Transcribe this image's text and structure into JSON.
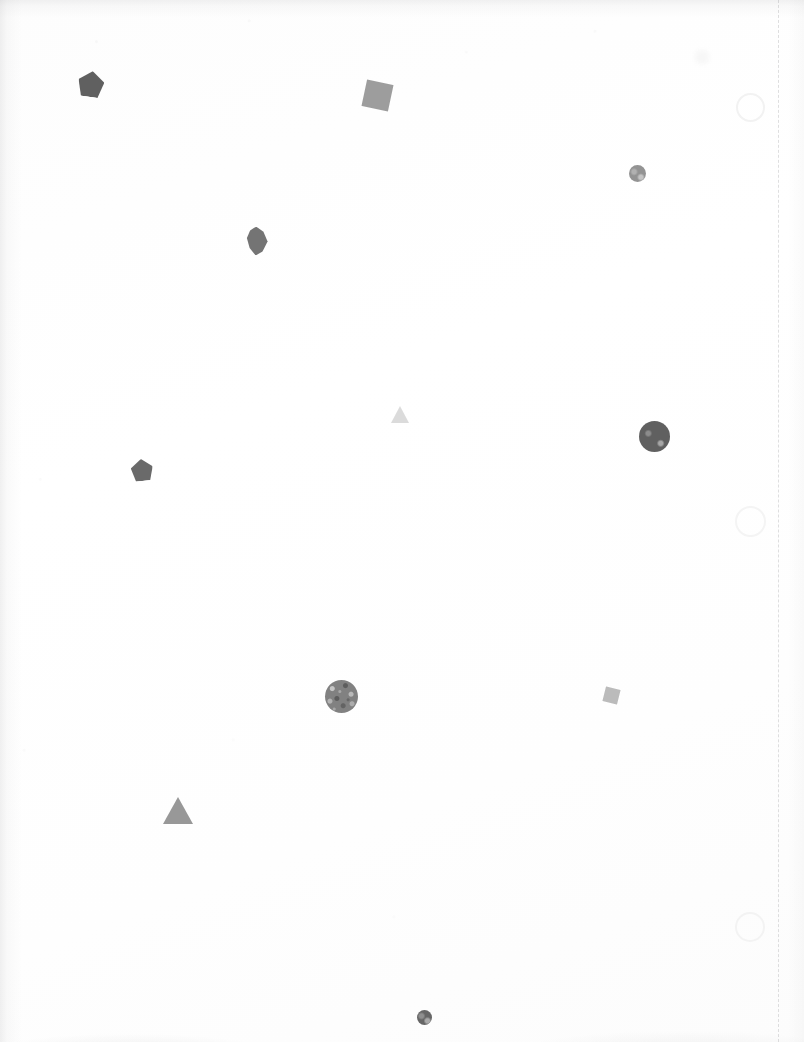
{
  "scene": {
    "title": "Scattered Geometric Shapes",
    "width": 804,
    "height": 1042,
    "background_color": "#ffffff",
    "medium": "scanned paper",
    "text_content": "none",
    "shape_count": 11,
    "ghost_shape_count": 4
  },
  "guides": [
    {
      "name": "dashed-vertical-guide",
      "x": 778,
      "color": "#969698",
      "style": "dashed",
      "width_px": 1
    }
  ],
  "shapes": [
    {
      "id": "pentagon-1",
      "type": "pentagon",
      "cx": 91,
      "cy": 84,
      "size": 26,
      "rotation": 8,
      "color": "#585858",
      "opacity": 0.95,
      "label": "dark pentagon upper left"
    },
    {
      "id": "square-1",
      "type": "square",
      "cx": 377,
      "cy": 95,
      "size": 27,
      "rotation": 12,
      "color": "#989898",
      "opacity": 0.95,
      "label": "mid gray rotated square upper middle"
    },
    {
      "id": "circle-1",
      "type": "circle",
      "cx": 637,
      "cy": 173,
      "size": 17,
      "rotation": 0,
      "color": "#8e8e8e",
      "opacity": 0.95,
      "label": "small gray circle upper right"
    },
    {
      "id": "blob-1",
      "type": "blob",
      "cx": 257,
      "cy": 241,
      "size": 29,
      "rotation": 0,
      "color": "#6d6d6d",
      "opacity": 0.95,
      "label": "irregular dark leaf shaped blob"
    },
    {
      "id": "triangle-1",
      "type": "triangle",
      "cx": 400,
      "cy": 414,
      "size": 19,
      "rotation": 0,
      "color": "#d8d8d8",
      "opacity": 0.9,
      "label": "very light small triangle center"
    },
    {
      "id": "circle-2",
      "type": "circle",
      "cx": 654,
      "cy": 419,
      "size": 31,
      "rotation": 0,
      "color": "#585858",
      "opacity": 0.95,
      "label": "large dark circle right of center"
    },
    {
      "id": "pentagon-2",
      "type": "pentagon",
      "cx": 142,
      "cy": 470,
      "size": 22,
      "rotation": -6,
      "color": "#626262",
      "opacity": 0.95,
      "label": "dark pentagon mid left"
    },
    {
      "id": "circle-3",
      "type": "circle-textured",
      "cx": 341,
      "cy": 648,
      "size": 33,
      "rotation": 0,
      "color": "#7b7b7b",
      "opacity": 0.95,
      "label": "mottled textured gray circle lower middle"
    },
    {
      "id": "square-2",
      "type": "square",
      "cx": 611,
      "cy": 695,
      "size": 15,
      "rotation": 14,
      "color": "#b4b4b4",
      "opacity": 0.9,
      "label": "small light rotated square lower right"
    },
    {
      "id": "triangle-2",
      "type": "triangle",
      "cx": 178,
      "cy": 810,
      "size": 31,
      "rotation": 0,
      "color": "#939393",
      "opacity": 0.95,
      "label": "medium gray triangle lower left"
    },
    {
      "id": "circle-4",
      "type": "circle",
      "cx": 424,
      "cy": 936,
      "size": 15,
      "rotation": 0,
      "color": "#5e5e5e",
      "opacity": 0.95,
      "label": "small dark circle bottom center"
    }
  ],
  "ghost_shapes": [
    {
      "id": "ghost-circle-1",
      "type": "circle-outline",
      "cx": 748,
      "cy": 105,
      "size": 25,
      "stroke": "#f2f2f2",
      "label": "faint circle outline upper right margin"
    },
    {
      "id": "ghost-circle-2",
      "type": "circle-outline",
      "cx": 748,
      "cy": 519,
      "size": 27,
      "stroke": "#f4f4f4",
      "label": "faint circle outline middle right margin"
    },
    {
      "id": "ghost-circle-3",
      "type": "circle-outline",
      "cx": 748,
      "cy": 925,
      "size": 26,
      "stroke": "#f3f3f3",
      "label": "faint circle outline lower right margin"
    },
    {
      "id": "ghost-mark-1",
      "type": "smudge",
      "cx": 702,
      "cy": 57,
      "size": 14,
      "stroke": "#f7f7f7",
      "label": "barely visible smudge mark top right"
    }
  ]
}
